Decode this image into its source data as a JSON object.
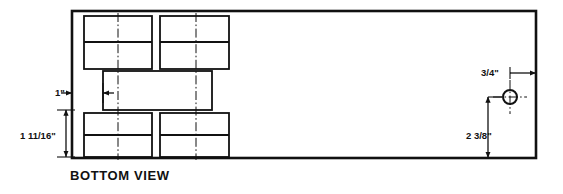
{
  "drawing": {
    "caption": "BOTTOM VIEW",
    "colors": {
      "line": "#111111",
      "background": "#ffffff",
      "centerline": "#111111"
    },
    "outline": {
      "name": "chassis-outline",
      "x": 72,
      "y": 11,
      "width": 464,
      "height": 147
    },
    "cutouts": [
      {
        "name": "cutout-top-left",
        "x": 84,
        "y": 16,
        "width": 68,
        "height": 53,
        "divider_offset": 26
      },
      {
        "name": "cutout-top-right",
        "x": 160,
        "y": 16,
        "width": 69,
        "height": 53,
        "divider_offset": 26
      },
      {
        "name": "cutout-middle",
        "x": 103,
        "y": 71,
        "width": 109,
        "height": 39,
        "divider_offset": null
      },
      {
        "name": "cutout-bottom-left",
        "x": 84,
        "y": 113,
        "width": 68,
        "height": 44,
        "divider_offset": 22
      },
      {
        "name": "cutout-bottom-right",
        "x": 160,
        "y": 113,
        "width": 69,
        "height": 44,
        "divider_offset": 22
      }
    ],
    "centerlines": [
      {
        "name": "centerline-left",
        "x": 118,
        "y1": 13,
        "y2": 160
      },
      {
        "name": "centerline-right",
        "x": 196,
        "y1": 13,
        "y2": 160
      }
    ],
    "hole": {
      "name": "mounting-hole",
      "cx": 510,
      "cy": 97,
      "r": 7,
      "crosshair_extent": 17
    },
    "dimensions": [
      {
        "name": "dimension-one-inch",
        "label": "1\"",
        "orientation": "horizontal",
        "from": 72,
        "to": 103,
        "axis": 93,
        "text_x": 55,
        "text_y": 96
      },
      {
        "name": "dimension-one-and-eleven-sixteenths",
        "label": "1 11/16\"",
        "orientation": "vertical",
        "from": 110,
        "to": 157,
        "axis": 66,
        "text_x": 20,
        "text_y": 139
      },
      {
        "name": "dimension-three-quarters",
        "label": "3/4\"",
        "orientation": "horizontal",
        "from": 510,
        "to": 536,
        "axis": 73,
        "text_x": 481,
        "text_y": 76
      },
      {
        "name": "dimension-two-and-three-eighths",
        "label": "2 3/8\"",
        "orientation": "vertical",
        "from": 97,
        "to": 158,
        "axis": 488,
        "text_x": 466,
        "text_y": 139
      }
    ]
  }
}
